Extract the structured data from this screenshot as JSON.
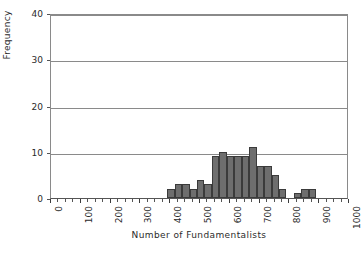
{
  "chart_data": {
    "type": "bar",
    "title": "",
    "subtitle": "",
    "xlabel": "Number of Fundamentalists",
    "ylabel": "Frequency",
    "xlim": [
      0,
      1000
    ],
    "ylim": [
      0,
      40
    ],
    "x_ticks": [
      0,
      100,
      200,
      300,
      400,
      500,
      600,
      700,
      800,
      900,
      1000
    ],
    "x_tick_labels": [
      "0",
      "100",
      "200",
      "300",
      "400",
      "500",
      "600",
      "700",
      "800",
      "900",
      "1000"
    ],
    "x_minor_tick_step": 25,
    "y_ticks": [
      0,
      10,
      20,
      30,
      40
    ],
    "y_tick_labels": [
      "0",
      "10",
      "20",
      "30",
      "40"
    ],
    "grid": "horizontal",
    "legend": "none",
    "bin_width": 25,
    "bars": [
      {
        "bin_start": 390,
        "bin_end": 415,
        "value": 2
      },
      {
        "bin_start": 415,
        "bin_end": 440,
        "value": 3
      },
      {
        "bin_start": 440,
        "bin_end": 465,
        "value": 3
      },
      {
        "bin_start": 465,
        "bin_end": 490,
        "value": 2
      },
      {
        "bin_start": 490,
        "bin_end": 515,
        "value": 4
      },
      {
        "bin_start": 515,
        "bin_end": 540,
        "value": 3
      },
      {
        "bin_start": 540,
        "bin_end": 565,
        "value": 9
      },
      {
        "bin_start": 565,
        "bin_end": 590,
        "value": 10
      },
      {
        "bin_start": 590,
        "bin_end": 615,
        "value": 9
      },
      {
        "bin_start": 615,
        "bin_end": 640,
        "value": 9
      },
      {
        "bin_start": 640,
        "bin_end": 665,
        "value": 9
      },
      {
        "bin_start": 665,
        "bin_end": 690,
        "value": 11
      },
      {
        "bin_start": 690,
        "bin_end": 715,
        "value": 7
      },
      {
        "bin_start": 715,
        "bin_end": 740,
        "value": 7
      },
      {
        "bin_start": 740,
        "bin_end": 765,
        "value": 5
      },
      {
        "bin_start": 765,
        "bin_end": 790,
        "value": 2
      },
      {
        "bin_start": 815,
        "bin_end": 840,
        "value": 1
      },
      {
        "bin_start": 840,
        "bin_end": 865,
        "value": 2
      },
      {
        "bin_start": 865,
        "bin_end": 890,
        "value": 2
      }
    ],
    "colors": {
      "bar_fill": "#6e6e6e",
      "bar_edge": "#3b3b3b",
      "gridline": "#8a8a8a",
      "axis": "#555555",
      "text": "#2b2b2b",
      "background": "#ffffff"
    }
  }
}
